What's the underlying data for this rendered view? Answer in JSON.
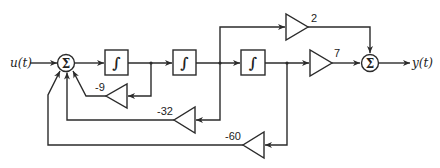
{
  "diagram": {
    "type": "block-diagram",
    "input_label": "u(t)",
    "output_label": "y(t)",
    "summing_symbol": "Σ",
    "integrator_symbol": "∫",
    "gains": {
      "feedforward_2": "2",
      "feedforward_7": "7",
      "feedback_9": "-9",
      "feedback_32": "-32",
      "feedback_60": "-60"
    },
    "blocks": [
      {
        "id": "sum1",
        "kind": "summing-junction"
      },
      {
        "id": "int1",
        "kind": "integrator"
      },
      {
        "id": "int2",
        "kind": "integrator"
      },
      {
        "id": "int3",
        "kind": "integrator"
      },
      {
        "id": "g2",
        "kind": "gain",
        "value": "2"
      },
      {
        "id": "g7",
        "kind": "gain",
        "value": "7"
      },
      {
        "id": "g-9",
        "kind": "gain",
        "value": "-9"
      },
      {
        "id": "g-32",
        "kind": "gain",
        "value": "-32"
      },
      {
        "id": "g-60",
        "kind": "gain",
        "value": "-60"
      },
      {
        "id": "sum2",
        "kind": "summing-junction"
      }
    ]
  }
}
